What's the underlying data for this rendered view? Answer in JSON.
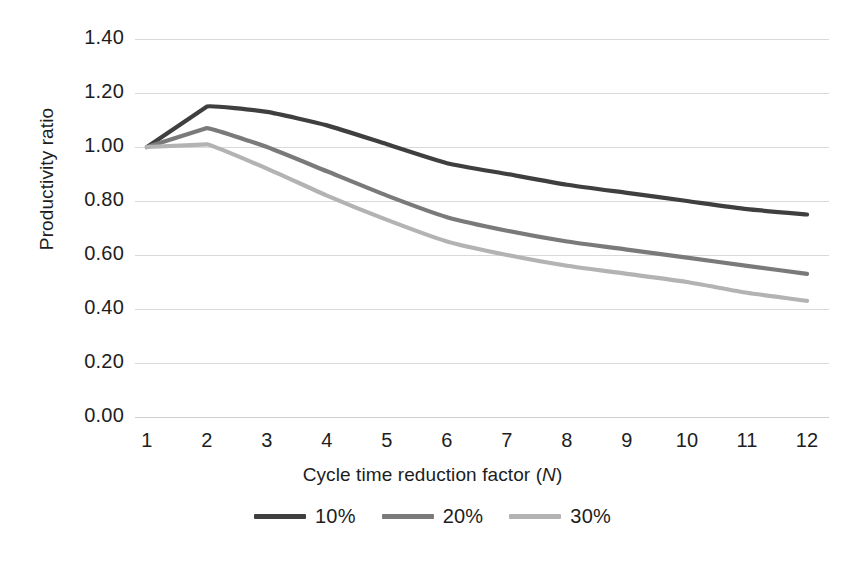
{
  "chart_data": {
    "type": "line",
    "title": "",
    "xlabel": "Cycle time reduction factor (N)",
    "xlabel_plain": "Cycle time reduction factor",
    "xlabel_italic_var": "N",
    "ylabel": "Productivity ratio",
    "categories": [
      1,
      2,
      3,
      4,
      5,
      6,
      7,
      8,
      9,
      10,
      11,
      12
    ],
    "x": [
      1,
      2,
      3,
      4,
      5,
      6,
      7,
      8,
      9,
      10,
      11,
      12
    ],
    "xlim": [
      1,
      12
    ],
    "ylim": [
      0.0,
      1.4
    ],
    "yticks": [
      "0.00",
      "0.20",
      "0.40",
      "0.60",
      "0.80",
      "1.00",
      "1.20",
      "1.40"
    ],
    "ytick_values": [
      0.0,
      0.2,
      0.4,
      0.6,
      0.8,
      1.0,
      1.2,
      1.4
    ],
    "grid": "horizontal",
    "legend_position": "bottom",
    "series": [
      {
        "name": "10%",
        "color": "#3f3f3f",
        "values": [
          1.0,
          1.15,
          1.13,
          1.08,
          1.01,
          0.94,
          0.9,
          0.86,
          0.83,
          0.8,
          0.77,
          0.75
        ]
      },
      {
        "name": "20%",
        "color": "#7a7a7a",
        "values": [
          1.0,
          1.07,
          1.0,
          0.91,
          0.82,
          0.74,
          0.69,
          0.65,
          0.62,
          0.59,
          0.56,
          0.53
        ]
      },
      {
        "name": "30%",
        "color": "#b3b3b3",
        "values": [
          1.0,
          1.01,
          0.92,
          0.82,
          0.73,
          0.65,
          0.6,
          0.56,
          0.53,
          0.5,
          0.46,
          0.43
        ]
      }
    ]
  },
  "axes": {
    "y_title": "Productivity ratio",
    "x_title_prefix": "Cycle time reduction factor (",
    "x_title_var": "N",
    "x_title_suffix": ")"
  },
  "colors": {
    "gridline": "#d9d9d9",
    "text": "#1d1d1d",
    "background": "#ffffff"
  }
}
